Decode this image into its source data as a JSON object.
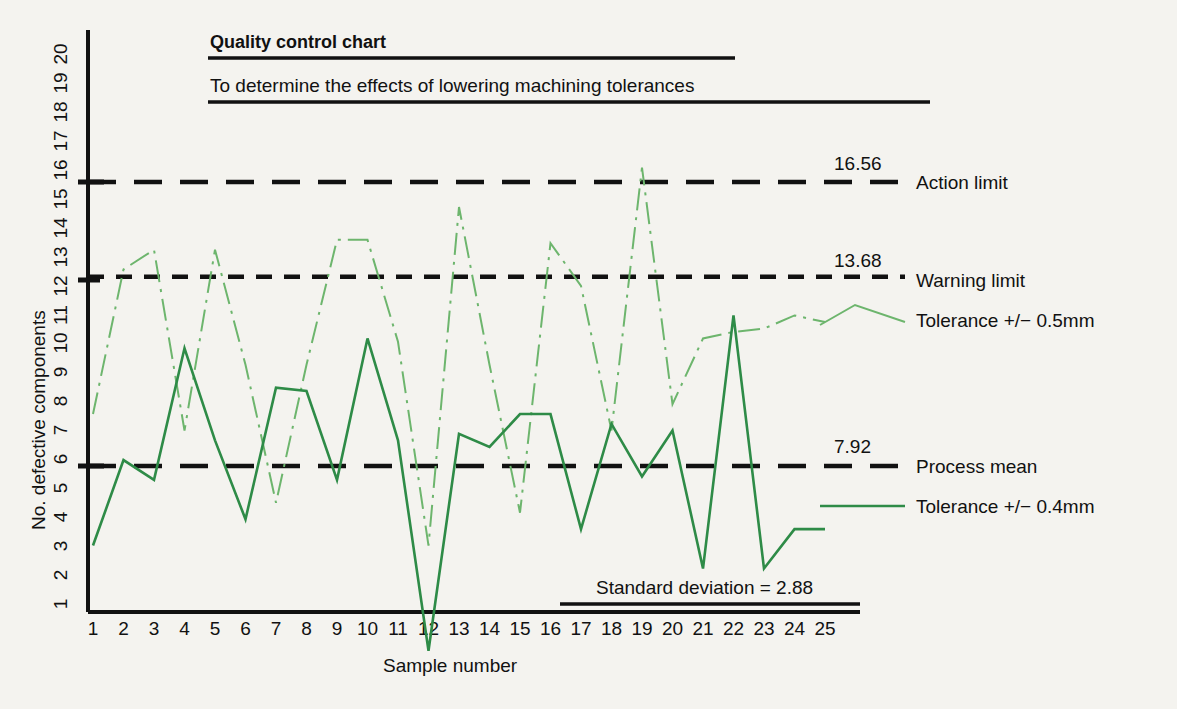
{
  "figure": {
    "title": "Quality control chart",
    "subtitle": "To determine the effects of lowering machining tolerances",
    "annotation": "Standard deviation = 2.88"
  },
  "axes": {
    "ylabel": "No. defective components",
    "xlabel": "Sample number",
    "yticks": [
      "1",
      "2",
      "3",
      "4",
      "5",
      "6",
      "7",
      "8",
      "9",
      "10",
      "11",
      "12",
      "13",
      "14",
      "15",
      "16",
      "17",
      "18",
      "19",
      "20"
    ],
    "xticks": [
      "1",
      "2",
      "3",
      "4",
      "5",
      "6",
      "7",
      "8",
      "9",
      "10",
      "11",
      "12",
      "13",
      "14",
      "15",
      "16",
      "17",
      "18",
      "19",
      "20",
      "21",
      "22",
      "23",
      "24",
      "25"
    ]
  },
  "limits": [
    {
      "name": "action-limit",
      "value": "16.56",
      "label": "Action limit"
    },
    {
      "name": "warning-limit",
      "value": "13.68",
      "label": "Warning limit"
    },
    {
      "name": "process-mean",
      "value": "7.92",
      "label": "Process mean"
    }
  ],
  "legend": [
    {
      "name": "tolerance-05",
      "label": "Tolerance +/− 0.5mm",
      "color": "#6db56d"
    },
    {
      "name": "tolerance-04",
      "label": "Tolerance +/− 0.4mm",
      "color": "#2e8b47"
    }
  ],
  "colors": {
    "background": "#f4f3ef",
    "axis": "#111111",
    "series_light": "#6db56d",
    "series_dark": "#2e8b47"
  },
  "chart_data": {
    "type": "line",
    "title": "Quality control chart",
    "subtitle": "To determine the effects of lowering machining tolerances",
    "xlabel": "Sample number",
    "ylabel": "No. defective components",
    "xlim": [
      1,
      25
    ],
    "ylim": [
      1,
      20
    ],
    "grid": false,
    "legend_position": "right",
    "x": [
      1,
      2,
      3,
      4,
      5,
      6,
      7,
      8,
      9,
      10,
      11,
      12,
      13,
      14,
      15,
      16,
      17,
      18,
      19,
      20,
      21,
      22,
      23,
      24,
      25
    ],
    "series": [
      {
        "name": "Tolerance +/- 0.5mm",
        "color": "#6db56d",
        "style": "dash-dot",
        "values": [
          9.5,
          13.9,
          14.5,
          9.0,
          14.5,
          11.0,
          6.8,
          11.0,
          14.8,
          14.8,
          11.7,
          5.5,
          15.8,
          11.0,
          6.5,
          14.7,
          13.4,
          9.0,
          17.0,
          9.8,
          11.8,
          12.0,
          12.1,
          12.5,
          12.3
        ]
      },
      {
        "name": "Tolerance +/- 0.4mm",
        "color": "#2e8b47",
        "style": "solid",
        "values": [
          5.5,
          8.1,
          7.5,
          11.5,
          8.7,
          6.3,
          10.3,
          10.2,
          7.5,
          11.8,
          8.7,
          2.3,
          8.9,
          8.5,
          9.5,
          9.5,
          6.0,
          9.2,
          7.6,
          9.0,
          4.8,
          12.5,
          4.8,
          6.0,
          6.0
        ]
      }
    ],
    "reference_lines": [
      {
        "label": "Action limit",
        "value": 16.56,
        "style": "long-dash"
      },
      {
        "label": "Warning limit",
        "value": 13.68,
        "style": "short-dash"
      },
      {
        "label": "Process mean",
        "value": 7.92,
        "style": "long-dash"
      }
    ],
    "annotations": [
      "Standard deviation = 2.88"
    ]
  }
}
